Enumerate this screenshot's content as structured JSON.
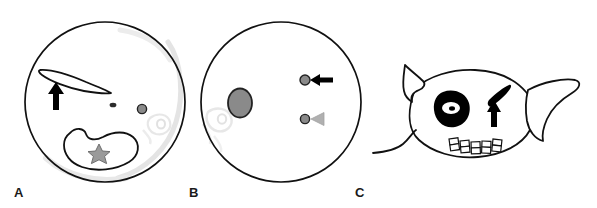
{
  "figure": {
    "type": "medical-imaging-schematic",
    "background_color": "#ffffff",
    "width": 597,
    "height": 208,
    "panel_count": 3
  },
  "colors": {
    "outline": "#111111",
    "fill_white": "#ffffff",
    "marker_gray": "#8a8a8a",
    "marker_gray_dark": "#6f6f6f",
    "arrowhead_gray": "#b0b0b0",
    "ghost_gray": "#e2e2e2",
    "black": "#000000",
    "label_text": "#1a1a1a"
  },
  "panels": [
    {
      "id": "A",
      "label": "A",
      "shape": "circle",
      "description": "axial cross-section outline",
      "center": [
        105,
        102
      ],
      "radius": 80,
      "elements": [
        {
          "name": "elongated-blade-structure",
          "type": "lens-outline",
          "fill": "#ffffff",
          "stroke": "#111111"
        },
        {
          "name": "black-arrow-up",
          "type": "arrow",
          "direction": "up",
          "color": "#000000"
        },
        {
          "name": "small-dark-dot",
          "type": "dot",
          "color": "#2a2a2a",
          "size": "tiny"
        },
        {
          "name": "gray-circle-marker",
          "type": "circle-marker",
          "fill": "#8a8a8a",
          "stroke": "#222222"
        },
        {
          "name": "kidney-shaped-outline",
          "type": "bean-outline",
          "fill": "#ffffff",
          "stroke": "#111111"
        },
        {
          "name": "gray-star-marker",
          "type": "star",
          "points": 6,
          "fill": "#9a9a9a",
          "stroke": "#6f6f6f"
        },
        {
          "name": "faint-inner-arc",
          "type": "ghost-arc",
          "color": "#e2e2e2"
        },
        {
          "name": "faint-ghost-structure",
          "type": "ghost-shape",
          "color": "#e8e8e8"
        }
      ]
    },
    {
      "id": "B",
      "label": "B",
      "shape": "circle",
      "description": "axial cross-section outline",
      "center": [
        281,
        102
      ],
      "radius": 80,
      "elements": [
        {
          "name": "gray-ellipse-mass",
          "type": "ellipse",
          "fill": "#8a8a8a",
          "stroke": "#222222"
        },
        {
          "name": "gray-dot-upper",
          "type": "circle-marker",
          "fill": "#8a8a8a",
          "stroke": "#222222"
        },
        {
          "name": "black-arrow-left",
          "type": "arrow",
          "direction": "left",
          "color": "#000000"
        },
        {
          "name": "gray-dot-lower",
          "type": "circle-marker",
          "fill": "#8a8a8a",
          "stroke": "#222222"
        },
        {
          "name": "gray-arrowhead-left",
          "type": "arrowhead",
          "direction": "left",
          "color": "#b0b0b0"
        },
        {
          "name": "faint-ghost-structure",
          "type": "ghost-shape",
          "color": "#e8e8e8"
        }
      ]
    },
    {
      "id": "C",
      "label": "C",
      "shape": "sagittal-profile",
      "description": "lateral sagittal schematic outline",
      "elements": [
        {
          "name": "body-outline",
          "type": "outline",
          "fill": "#ffffff",
          "stroke": "#111111"
        },
        {
          "name": "upper-fin-outline",
          "type": "outline",
          "fill": "#ffffff",
          "stroke": "#111111"
        },
        {
          "name": "tail-fin-outline",
          "type": "outline",
          "fill": "#ffffff",
          "stroke": "#111111"
        },
        {
          "name": "lower-contour-line",
          "type": "open-curve",
          "stroke": "#111111"
        },
        {
          "name": "black-eye-blob",
          "type": "filled-blob",
          "fill": "#000000"
        },
        {
          "name": "eye-white-oval",
          "type": "oval",
          "fill": "#ffffff"
        },
        {
          "name": "eye-pupil-dot",
          "type": "dot",
          "fill": "#000000"
        },
        {
          "name": "black-blade-structure",
          "type": "filled-blade",
          "fill": "#000000"
        },
        {
          "name": "black-arrow-up",
          "type": "arrow",
          "direction": "up",
          "color": "#000000"
        },
        {
          "name": "segment-row",
          "type": "rectangle-row",
          "count": 5,
          "cells_per_segment": 2,
          "stroke": "#111111"
        }
      ]
    }
  ]
}
